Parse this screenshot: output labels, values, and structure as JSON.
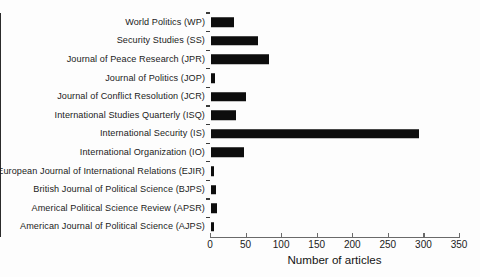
{
  "chart_data": {
    "type": "bar",
    "orientation": "horizontal",
    "title": "",
    "xlabel": "Number of articles",
    "ylabel": "",
    "xlim": [
      0,
      350
    ],
    "xticks": [
      0,
      50,
      100,
      150,
      200,
      250,
      300,
      350
    ],
    "grid": false,
    "legend": null,
    "bar_color": "#0d0d0d",
    "categories": [
      "World Politics (WP)",
      "Security Studies (SS)",
      "Journal of Peace Research (JPR)",
      "Journal of Politics (JOP)",
      "Journal of Conflict Resolution (JCR)",
      "International Studies Quarterly (ISQ)",
      "International Security (IS)",
      "International Organization (IO)",
      "European Journal of International Relations (EJIR)",
      "British Journal of Political Science (BJPS)",
      "Americal Political Science Review (APSR)",
      "American Journal of Political Science (AJPS)"
    ],
    "values": [
      32,
      66,
      82,
      5,
      49,
      35,
      292,
      46,
      4,
      7,
      9,
      4
    ]
  }
}
